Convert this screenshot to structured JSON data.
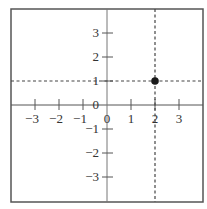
{
  "chart_data": {
    "type": "scatter",
    "title": "",
    "xlabel": "",
    "ylabel": "",
    "xlim": [
      -4,
      4
    ],
    "ylim": [
      -4,
      4
    ],
    "grid": false,
    "x_ticks": [
      -3,
      -2,
      -1,
      0,
      1,
      2,
      3
    ],
    "y_ticks": [
      -3,
      -2,
      -1,
      0,
      1,
      2,
      3
    ],
    "x_tick_labels": [
      "−3",
      "−2",
      "−1",
      "0",
      "1",
      "2",
      "3"
    ],
    "y_tick_labels": [
      "−3",
      "−2",
      "−1",
      "0",
      "1",
      "2",
      "3"
    ],
    "points": [
      {
        "x": 2,
        "y": 1
      }
    ],
    "annotations": [
      {
        "type": "dashed-vertical-line",
        "x": 2
      },
      {
        "type": "dashed-horizontal-line",
        "y": 1
      }
    ]
  },
  "colors": {
    "border": "#555555",
    "axis": "#555555",
    "point": "#1a1a1a",
    "guide": "#444444",
    "label": "#333333"
  }
}
